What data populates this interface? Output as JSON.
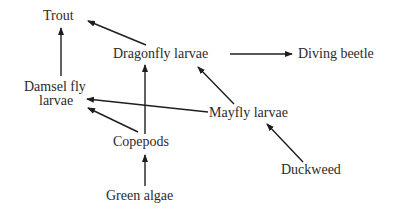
{
  "diagram": {
    "type": "food-web",
    "colors": {
      "text": "#2b2b2b",
      "arrow": "#1e1e1e",
      "background": "#ffffff"
    },
    "nodes": {
      "trout": {
        "label": "Trout"
      },
      "dragonfly": {
        "label": "Dragonfly larvae"
      },
      "diving_beetle": {
        "label": "Diving beetle"
      },
      "damselfly_line1": {
        "label": "Damsel fly"
      },
      "damselfly_line2": {
        "label": "larvae"
      },
      "mayfly": {
        "label": "Mayfly larvae"
      },
      "copepods": {
        "label": "Copepods"
      },
      "duckweed": {
        "label": "Duckweed"
      },
      "green_algae": {
        "label": "Green algae"
      }
    },
    "edges": [
      {
        "from": "Dragonfly larvae",
        "to": "Trout"
      },
      {
        "from": "Damsel fly larvae",
        "to": "Trout"
      },
      {
        "from": "Dragonfly larvae",
        "to": "Diving beetle"
      },
      {
        "from": "Mayfly larvae",
        "to": "Dragonfly larvae"
      },
      {
        "from": "Mayfly larvae",
        "to": "Damsel fly larvae"
      },
      {
        "from": "Copepods",
        "to": "Damsel fly larvae"
      },
      {
        "from": "Copepods",
        "to": "Dragonfly larvae"
      },
      {
        "from": "Green algae",
        "to": "Copepods"
      },
      {
        "from": "Duckweed",
        "to": "Mayfly larvae"
      }
    ]
  }
}
